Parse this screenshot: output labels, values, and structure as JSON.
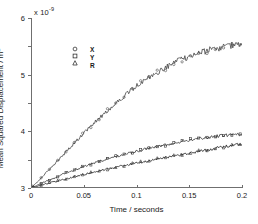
{
  "chart_data": {
    "type": "line",
    "title": "",
    "subtitle": "",
    "xlabel": "Time / seconds",
    "ylabel": "Mean Squared Displacement / m",
    "ylabel_sup": "2",
    "y_exponent_label": "x 10",
    "y_exponent_value": "-9",
    "xlim": [
      0,
      0.2
    ],
    "ylim": [
      0,
      6
    ],
    "xticks": [
      0,
      0.05,
      0.1,
      0.15,
      0.2
    ],
    "xticklabels": [
      "0",
      "0.05",
      "0.1",
      "0.15",
      "0.2"
    ],
    "yticks": [
      0,
      1,
      2,
      3,
      4,
      5,
      6
    ],
    "yticklabels": [
      "0",
      "1",
      "2",
      "3",
      "4",
      "5",
      "6"
    ],
    "grid": false,
    "legend_position": "upper-left",
    "noise_amplitude": 0.045,
    "series": [
      {
        "name": "R",
        "marker": "circle",
        "color": "#4d4d4d",
        "x": [
          0,
          0.005,
          0.01,
          0.015,
          0.02,
          0.025,
          0.03,
          0.035,
          0.04,
          0.045,
          0.05,
          0.06,
          0.07,
          0.08,
          0.09,
          0.1,
          0.11,
          0.12,
          0.13,
          0.14,
          0.15,
          0.16,
          0.17,
          0.18,
          0.19,
          0.2
        ],
        "values": [
          0,
          0.18,
          0.37,
          0.56,
          0.76,
          0.95,
          1.15,
          1.35,
          1.55,
          1.74,
          1.93,
          2.3,
          2.65,
          2.98,
          3.3,
          3.6,
          3.85,
          4.08,
          4.3,
          4.5,
          4.65,
          4.78,
          4.88,
          4.96,
          5.03,
          5.1
        ]
      },
      {
        "name": "X",
        "marker": "square",
        "color": "#3a3a3a",
        "x": [
          0,
          0.005,
          0.01,
          0.015,
          0.02,
          0.025,
          0.03,
          0.035,
          0.04,
          0.045,
          0.05,
          0.06,
          0.07,
          0.08,
          0.09,
          0.1,
          0.11,
          0.12,
          0.13,
          0.14,
          0.15,
          0.16,
          0.17,
          0.18,
          0.19,
          0.2
        ],
        "values": [
          0,
          0.08,
          0.16,
          0.24,
          0.32,
          0.4,
          0.48,
          0.55,
          0.62,
          0.69,
          0.76,
          0.89,
          1.0,
          1.1,
          1.2,
          1.29,
          1.38,
          1.46,
          1.54,
          1.62,
          1.69,
          1.75,
          1.8,
          1.85,
          1.88,
          1.9
        ]
      },
      {
        "name": "Y",
        "marker": "triangle",
        "color": "#2b2b2b",
        "x": [
          0,
          0.005,
          0.01,
          0.015,
          0.02,
          0.025,
          0.03,
          0.035,
          0.04,
          0.045,
          0.05,
          0.06,
          0.07,
          0.08,
          0.09,
          0.1,
          0.11,
          0.12,
          0.13,
          0.14,
          0.15,
          0.16,
          0.17,
          0.18,
          0.19,
          0.2
        ],
        "values": [
          0,
          0.05,
          0.1,
          0.15,
          0.2,
          0.25,
          0.3,
          0.34,
          0.39,
          0.43,
          0.48,
          0.56,
          0.65,
          0.73,
          0.8,
          0.88,
          0.95,
          1.02,
          1.09,
          1.16,
          1.23,
          1.3,
          1.37,
          1.44,
          1.5,
          1.55
        ]
      }
    ],
    "legend_entries": [
      {
        "label": "X",
        "marker": "circle"
      },
      {
        "label": "Y",
        "marker": "square"
      },
      {
        "label": "R",
        "marker": "triangle"
      }
    ]
  }
}
